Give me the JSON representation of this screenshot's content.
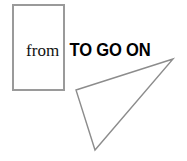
{
  "canvas": {
    "width": 187,
    "height": 161,
    "background_color": "#ffffff"
  },
  "text": {
    "from_label": "from",
    "phrase_label": "TO GO ON"
  },
  "shapes": {
    "rectangle": {
      "name": "rectangle-outline",
      "x": 12,
      "y": 4,
      "width": 53,
      "height": 87,
      "stroke_color": "#9a9a9a",
      "stroke_width": 2,
      "fill": "none"
    },
    "triangle": {
      "name": "triangle-outline",
      "points": "76,90 173,59 95,150",
      "vertices": [
        {
          "x": 76,
          "y": 90
        },
        {
          "x": 173,
          "y": 59
        },
        {
          "x": 95,
          "y": 150
        }
      ],
      "stroke_color": "#8c8c8c",
      "stroke_width": 1.4,
      "fill": "none"
    }
  }
}
